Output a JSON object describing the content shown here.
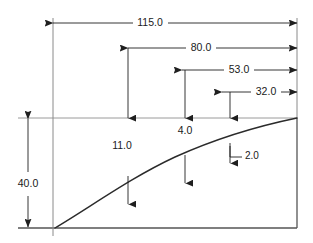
{
  "drawing": {
    "title": "Dimensioned airfoil-style profile section",
    "background_color": "#ffffff",
    "line_color": "#3c3c3c",
    "profile_color": "#2b2b2b",
    "text_color": "#1a1a1a",
    "units_note": "",
    "horizontal_dimensions": [
      {
        "id": "dim-115",
        "label": "115.0",
        "value": 115.0,
        "label_x": 142,
        "label_y": 23,
        "line_y": 23,
        "x_start": 53,
        "x_end": 297
      },
      {
        "id": "dim-80",
        "label": "80.0",
        "value": 80.0,
        "label_x": 197,
        "label_y": 48,
        "line_y": 48,
        "x_start": 128,
        "x_end": 297
      },
      {
        "id": "dim-53",
        "label": "53.0",
        "value": 53.0,
        "label_x": 238,
        "label_y": 70,
        "line_y": 70,
        "x_start": 182,
        "x_end": 297
      },
      {
        "id": "dim-32",
        "label": "32.0",
        "value": 32.0,
        "label_x": 267,
        "label_y": 92,
        "line_y": 92,
        "x_start": 222,
        "x_end": 297
      }
    ],
    "vertical_dimensions": [
      {
        "id": "dim-40",
        "label": "40.0",
        "value": 40.0,
        "label_x": 28,
        "label_y": 184,
        "line_x": 28,
        "y_top": 118,
        "y_bottom": 228
      }
    ],
    "ordinate_callouts": [
      {
        "id": "callout-11",
        "label": "11.0",
        "value": 11.0,
        "x": 128,
        "label_x": 122,
        "label_y": 145,
        "arrow_top_y": 118,
        "curve_y": 176,
        "tail_y": 204
      },
      {
        "id": "callout-4",
        "label": "4.0",
        "value": 4.0,
        "x": 185,
        "label_x": 184,
        "label_y": 131,
        "arrow_top_y": 118,
        "curve_y": 155,
        "tail_y": 183
      },
      {
        "id": "callout-2",
        "label": "2.0",
        "value": 2.0,
        "x": 230,
        "label_x": 250,
        "label_y": 155,
        "arrow_top_y": 118,
        "curve_y": 143,
        "tail_y": 163,
        "leader_corner_x": 238,
        "leader_corner_y": 155
      }
    ],
    "geometry": {
      "left_extension_x": 53,
      "right_extension_x": 297,
      "top_reference_y": 118,
      "baseline_y": 228,
      "reference_x_start": 18,
      "profile_start_x": 55,
      "profile_start_y": 228,
      "profile_end_x": 297,
      "profile_end_y": 118,
      "profile_path": "M 55 228 C 92 206, 130 178, 175 157 C 215 139, 258 126, 297 118"
    }
  }
}
